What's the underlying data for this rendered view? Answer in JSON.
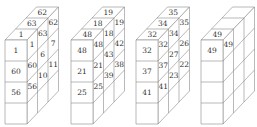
{
  "diagram": {
    "type": "stacked-cube-puzzle",
    "geometry": {
      "front_top_y": 40,
      "cell_width": 22,
      "cell_height": 21,
      "rows": 4,
      "depth_cells": 3,
      "depth_dx": 10.5,
      "depth_dy": -11,
      "line_color": "#8a8a8a",
      "text_color": "#333333"
    },
    "figures": [
      {
        "id": "figure-1",
        "front_x": 5,
        "front": [
          "1",
          "60",
          "56",
          ""
        ],
        "top": [
          "1",
          "63",
          "62"
        ],
        "side": [
          [
            "1",
            "60",
            "56",
            ""
          ],
          [
            "63",
            "6",
            "10",
            ""
          ],
          [
            "62",
            "7",
            "11",
            ""
          ]
        ]
      },
      {
        "id": "figure-2",
        "front_x": 71,
        "front": [
          "48",
          "21",
          "25",
          ""
        ],
        "top": [
          "48",
          "18",
          "19"
        ],
        "side": [
          [
            "48",
            "21",
            "25",
            ""
          ],
          [
            "18",
            "43",
            "39",
            ""
          ],
          [
            "19",
            "42",
            "38",
            ""
          ]
        ]
      },
      {
        "id": "figure-3",
        "front_x": 136,
        "front": [
          "32",
          "37",
          "41",
          ""
        ],
        "top": [
          "32",
          "34",
          "35"
        ],
        "side": [
          [
            "32",
            "37",
            "41",
            ""
          ],
          [
            "34",
            "27",
            "23",
            ""
          ],
          [
            "35",
            "26",
            "22",
            ""
          ]
        ]
      },
      {
        "id": "figure-4",
        "front_x": 201,
        "front": [
          "49",
          "",
          "",
          ""
        ],
        "top": [
          "49",
          "",
          ""
        ],
        "side": [
          [
            "49",
            "",
            "",
            ""
          ],
          [
            "",
            "",
            "",
            ""
          ],
          [
            "",
            "",
            "",
            ""
          ]
        ]
      }
    ]
  }
}
